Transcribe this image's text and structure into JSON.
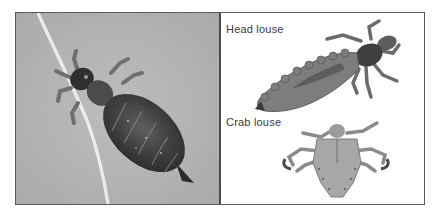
{
  "figure": {
    "left_panel": {
      "subject": "body louse on hair strand",
      "background_color": "#b4b6b6"
    },
    "right_panel": {
      "labels": [
        {
          "id": "head",
          "text": "Head louse"
        },
        {
          "id": "crab",
          "text": "Crab louse"
        }
      ],
      "background_color": "#ffffff"
    },
    "border_color": "#5a5a5a"
  }
}
